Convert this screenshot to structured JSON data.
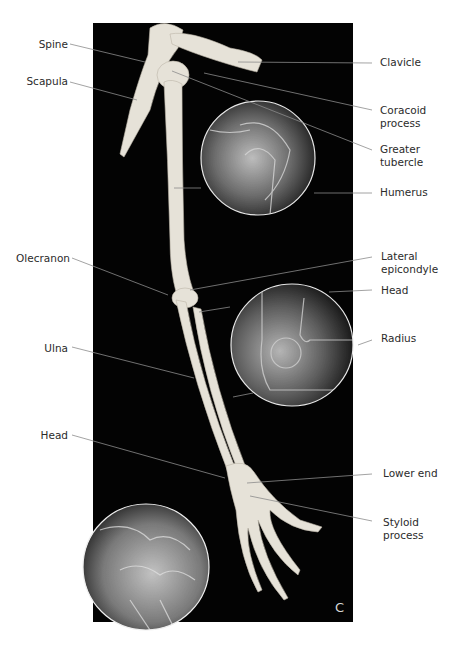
{
  "figure": {
    "panel_letter": "C",
    "background_color": "#030303",
    "bone_color": "#e8e4da",
    "leader_line_color": "#8a8a8a",
    "insets": [
      {
        "name": "shoulder-xray-inset",
        "description": "X-ray of shoulder joint"
      },
      {
        "name": "elbow-xray-inset",
        "description": "X-ray of elbow joint"
      },
      {
        "name": "wrist-xray-inset",
        "description": "X-ray of wrist joint"
      }
    ],
    "labels_left": {
      "spine": "Spine",
      "scapula": "Scapula",
      "olecranon": "Olecranon",
      "ulna": "Ulna",
      "ulna_head": "Head"
    },
    "labels_right": {
      "clavicle": "Clavicle",
      "coracoid": "Coracoid\nprocess",
      "greater_tubercle": "Greater\ntubercle",
      "humerus": "Humerus",
      "lateral_epicondyle": "Lateral\nepicondyle",
      "radius_head": "Head",
      "radius": "Radius",
      "lower_end": "Lower end",
      "styloid": "Styloid\nprocess"
    }
  }
}
